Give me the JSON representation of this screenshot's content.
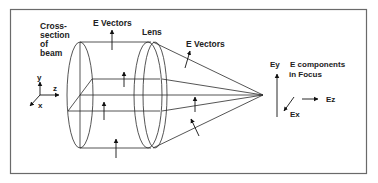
{
  "diagram": {
    "labels": {
      "cross_section": [
        "Cross-",
        "section",
        "of",
        "beam"
      ],
      "e_vectors_left": "E Vectors",
      "lens": "Lens",
      "e_vectors_right": "E Vectors",
      "e_components": [
        "E components",
        "in Focus"
      ],
      "ey": "Ey",
      "ez": "Ez",
      "ex": "Ex",
      "axis_y": "y",
      "axis_z": "z",
      "axis_x": "x"
    },
    "colors": {
      "line": "#2a2a2a",
      "frame": "#6a6a6a",
      "background": "#ffffff"
    }
  }
}
